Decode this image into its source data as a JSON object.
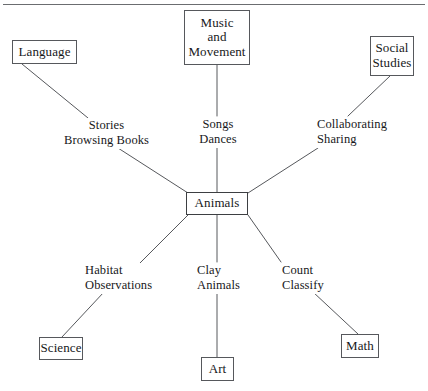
{
  "diagram": {
    "type": "concept-web",
    "title": "Animals",
    "center": {
      "id": "animals",
      "label": "Animals"
    },
    "topic_nodes": [
      {
        "id": "language",
        "label": "Language"
      },
      {
        "id": "music-and-movement",
        "label": "Music\nand\nMovement",
        "lines": [
          "Music",
          "and",
          "Movement"
        ]
      },
      {
        "id": "social-studies",
        "label": "Social\nStudies",
        "lines": [
          "Social",
          "Studies"
        ]
      },
      {
        "id": "science",
        "label": "Science"
      },
      {
        "id": "art",
        "label": "Art"
      },
      {
        "id": "math",
        "label": "Math"
      }
    ],
    "connections": [
      {
        "id": "language-link",
        "from": "language",
        "to": "animals",
        "activities": [
          "Stories",
          "Browsing Books"
        ]
      },
      {
        "id": "music-and-movement-link",
        "from": "music-and-movement",
        "to": "animals",
        "activities": [
          "Songs",
          "Dances"
        ]
      },
      {
        "id": "social-studies-link",
        "from": "social-studies",
        "to": "animals",
        "activities": [
          "Collaborating",
          "Sharing"
        ]
      },
      {
        "id": "science-link",
        "from": "science",
        "to": "animals",
        "activities": [
          "Habitat",
          "Observations"
        ]
      },
      {
        "id": "art-link",
        "from": "art",
        "to": "animals",
        "activities": [
          "Clay",
          "Animals"
        ]
      },
      {
        "id": "math-link",
        "from": "math",
        "to": "animals",
        "activities": [
          "Count",
          "Classify"
        ]
      }
    ],
    "colors": {
      "line": "#56585c",
      "text": "#17181a",
      "background": "#ffffff",
      "rule": "#6b6d70"
    }
  }
}
